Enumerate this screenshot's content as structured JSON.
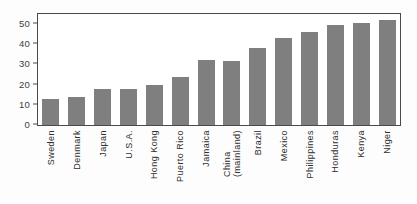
{
  "chart_data": {
    "type": "bar",
    "title": "",
    "subtitle": "",
    "xlabel": "",
    "ylabel": "",
    "ylim": [
      0,
      55
    ],
    "yticks": [
      0,
      10,
      20,
      30,
      40,
      50
    ],
    "grid": false,
    "legend": null,
    "bar_color": "#7f7f7f",
    "frame_color": "#4a4a4a",
    "background_color": "#ffffff",
    "categories": [
      "Sweden",
      "Denmark",
      "Japan",
      "U.S.A.",
      "Hong Kong",
      "Puerto Rico",
      "Jamaica",
      "China (mainland)",
      "Brazil",
      "Mexico",
      "Philippines",
      "Honduras",
      "Kenya",
      "Niger"
    ],
    "category_lines": [
      [
        "Sweden"
      ],
      [
        "Denmark"
      ],
      [
        "Japan"
      ],
      [
        "U.S.A."
      ],
      [
        "Hong Kong"
      ],
      [
        "Puerto Rico"
      ],
      [
        "Jamaica"
      ],
      [
        "China",
        "(mainland)"
      ],
      [
        "Brazil"
      ],
      [
        "Mexico"
      ],
      [
        "Philippines"
      ],
      [
        "Honduras"
      ],
      [
        "Kenya"
      ],
      [
        "Niger"
      ]
    ],
    "values": [
      13,
      14,
      18,
      18,
      20,
      24,
      32,
      31.5,
      38,
      43,
      46,
      49.5,
      50.5,
      52
    ]
  }
}
